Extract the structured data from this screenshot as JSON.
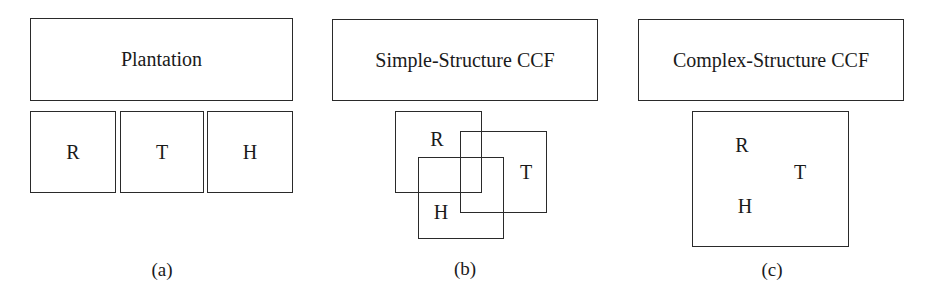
{
  "panels": [
    {
      "id": "a",
      "title": "Plantation",
      "components": [
        "R",
        "T",
        "H"
      ],
      "arrangement": "separate",
      "caption": "(a)"
    },
    {
      "id": "b",
      "title": "Simple-Structure CCF",
      "components": [
        "R",
        "T",
        "H"
      ],
      "arrangement": "overlapping",
      "caption": "(b)"
    },
    {
      "id": "c",
      "title": "Complex-Structure CCF",
      "components": [
        "R",
        "T",
        "H"
      ],
      "arrangement": "mixed",
      "caption": "(c)"
    }
  ]
}
